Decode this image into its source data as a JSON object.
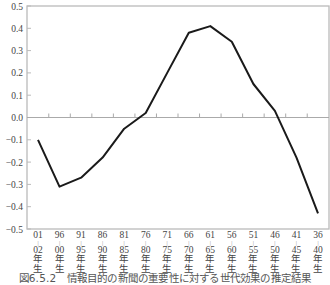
{
  "chart_data": {
    "type": "line",
    "title": "",
    "caption": "図6.5.2　情報目的の新聞の重要性に対する世代効果の推定結果",
    "xlabel": "",
    "ylabel": "",
    "ylim": [
      -0.5,
      0.5
    ],
    "yticks": [
      0.5,
      0.4,
      0.3,
      0.2,
      0.1,
      0.0,
      -0.1,
      -0.2,
      -0.3,
      -0.4,
      -0.5
    ],
    "ytick_labels": [
      "0.5",
      "0.4",
      "0.3",
      "0.2",
      "0.1",
      "0.0",
      "−0.1",
      "−0.2",
      "−0.3",
      "−0.4",
      "−0.5"
    ],
    "categories": [
      {
        "from": "01",
        "to": "02",
        "suffix1": "年",
        "suffix2": "生"
      },
      {
        "from": "96",
        "to": "00",
        "suffix1": "年",
        "suffix2": "生"
      },
      {
        "from": "91",
        "to": "95",
        "suffix1": "年",
        "suffix2": "生"
      },
      {
        "from": "86",
        "to": "90",
        "suffix1": "年",
        "suffix2": "生"
      },
      {
        "from": "81",
        "to": "85",
        "suffix1": "年",
        "suffix2": "生"
      },
      {
        "from": "76",
        "to": "80",
        "suffix1": "年",
        "suffix2": "生"
      },
      {
        "from": "71",
        "to": "75",
        "suffix1": "年",
        "suffix2": "生"
      },
      {
        "from": "66",
        "to": "70",
        "suffix1": "年",
        "suffix2": "生"
      },
      {
        "from": "61",
        "to": "65",
        "suffix1": "年",
        "suffix2": "生"
      },
      {
        "from": "56",
        "to": "60",
        "suffix1": "年",
        "suffix2": "生"
      },
      {
        "from": "51",
        "to": "55",
        "suffix1": "年",
        "suffix2": "生"
      },
      {
        "from": "46",
        "to": "50",
        "suffix1": "年",
        "suffix2": "生"
      },
      {
        "from": "41",
        "to": "45",
        "suffix1": "年",
        "suffix2": "生"
      },
      {
        "from": "36",
        "to": "40",
        "suffix1": "年",
        "suffix2": "生"
      }
    ],
    "series": [
      {
        "name": "世代効果",
        "color": "#1a1a1a",
        "values": [
          -0.1,
          -0.31,
          -0.27,
          -0.18,
          -0.05,
          0.02,
          0.2,
          0.38,
          0.41,
          0.34,
          0.15,
          0.03,
          -0.18,
          -0.43
        ]
      }
    ],
    "grid": false,
    "zero_line": true,
    "legend": "none",
    "frame_color": "#bbbbbb",
    "zero_line_color": "#aaaaaa"
  }
}
